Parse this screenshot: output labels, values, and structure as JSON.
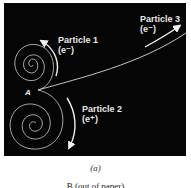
{
  "figure": {
    "panel_background": "#050505",
    "track_color": "#d8d8d8",
    "point_label": "A",
    "particles": [
      {
        "name": "Particle 1",
        "charge": "(e⁻)",
        "direction": "counterclockwise-spiral-up"
      },
      {
        "name": "Particle 2",
        "charge": "(e⁺)",
        "direction": "clockwise-spiral-down"
      },
      {
        "name": "Particle 3",
        "charge": "(e⁻)",
        "direction": "up-right-curve"
      }
    ],
    "caption": "(a)",
    "bottom_text": "B (out of paper)"
  }
}
